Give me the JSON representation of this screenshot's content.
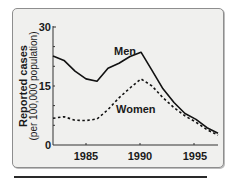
{
  "chart_data": {
    "type": "line",
    "title": "",
    "xlabel": "",
    "ylabel": "Reported cases",
    "ylabel_sub": "(per 100,000 population)",
    "x": [
      1982,
      1983,
      1984,
      1985,
      1986,
      1987,
      1988,
      1989,
      1990,
      1991,
      1992,
      1993,
      1994,
      1995,
      1996,
      1997
    ],
    "series": [
      {
        "name": "Men",
        "style": "solid",
        "values": [
          22.6,
          21.5,
          18.8,
          16.8,
          16.2,
          19.5,
          20.8,
          22.5,
          23.6,
          19.0,
          14.3,
          10.8,
          8.0,
          6.5,
          4.4,
          3.0
        ]
      },
      {
        "name": "Women",
        "style": "dashed",
        "values": [
          6.8,
          7.2,
          6.3,
          6.2,
          6.6,
          9.0,
          12.0,
          14.5,
          16.8,
          15.0,
          12.0,
          9.5,
          7.4,
          5.8,
          3.9,
          2.5
        ]
      }
    ],
    "xticks": [
      1985,
      1990,
      1995
    ],
    "yticks": [
      0,
      15,
      30
    ],
    "xlim": [
      1982,
      1997
    ],
    "ylim": [
      0,
      30
    ],
    "grid": false,
    "legend": "inline labels"
  },
  "labels": {
    "ylabel": "Reported cases",
    "ylabel_sub": "(per 100,000 population)",
    "men": "Men",
    "women": "Women",
    "y0": "0",
    "y15": "15",
    "y30": "30",
    "x1985": "1985",
    "x1990": "1990",
    "x1995": "1995"
  }
}
